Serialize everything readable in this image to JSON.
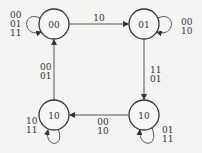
{
  "diagram": {
    "type": "state-transition",
    "states": [
      {
        "id": "s00",
        "label": "00"
      },
      {
        "id": "s01",
        "label": "01"
      },
      {
        "id": "s10a",
        "label": "10"
      },
      {
        "id": "s10b",
        "label": "10"
      }
    ],
    "transitions": [
      {
        "from": "s00",
        "to": "s00",
        "labels": [
          "00",
          "01",
          "11"
        ]
      },
      {
        "from": "s00",
        "to": "s01",
        "labels": [
          "10"
        ]
      },
      {
        "from": "s01",
        "to": "s01",
        "labels": [
          "00",
          "10"
        ]
      },
      {
        "from": "s01",
        "to": "s10b",
        "labels": [
          "11",
          "01"
        ]
      },
      {
        "from": "s10b",
        "to": "s10b",
        "labels": [
          "01",
          "11"
        ]
      },
      {
        "from": "s10b",
        "to": "s10a",
        "labels": [
          "00",
          "10"
        ]
      },
      {
        "from": "s10a",
        "to": "s10a",
        "labels": [
          "10",
          "11"
        ]
      },
      {
        "from": "s10a",
        "to": "s00",
        "labels": [
          "00",
          "01"
        ]
      }
    ]
  }
}
